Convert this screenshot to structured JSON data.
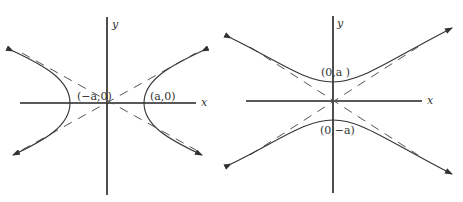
{
  "figures": [
    {
      "id": "horizontal-hyperbola",
      "x_axis_label": "x",
      "y_axis_label": "y",
      "vertex_left_label": "(−a,0)",
      "vertex_right_label": "(a,0)"
    },
    {
      "id": "vertical-hyperbola",
      "x_axis_label": "x",
      "y_axis_label": "y",
      "vertex_top_label": "(0,a )",
      "vertex_bottom_label": "(0,−a)"
    }
  ],
  "colors": {
    "curve": "#333333",
    "axis": "#222222",
    "asymptote": "#555555"
  }
}
